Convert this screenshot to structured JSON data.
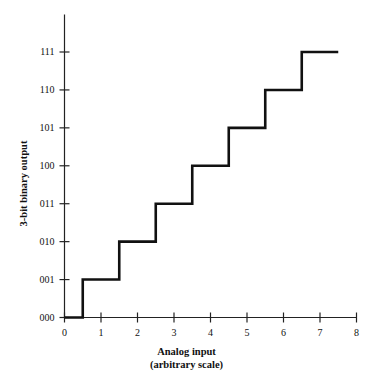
{
  "chart_data": {
    "type": "line",
    "title": "",
    "subtitle": "",
    "xlabel": "Analog input",
    "xlabel_line2": "(arbitrary scale)",
    "ylabel": "3-bit binary output",
    "xlim": [
      0,
      8
    ],
    "ylim": [
      0,
      7
    ],
    "grid": false,
    "legend": null,
    "x_ticks": [
      0,
      1,
      2,
      3,
      4,
      5,
      6,
      7,
      8
    ],
    "x_tick_labels": [
      "0",
      "1",
      "2",
      "3",
      "4",
      "5",
      "6",
      "7",
      "8"
    ],
    "y_ticks": [
      0,
      1,
      2,
      3,
      4,
      5,
      6,
      7
    ],
    "y_tick_labels": [
      "000",
      "001",
      "010",
      "011",
      "100",
      "101",
      "110",
      "111"
    ],
    "series": [
      {
        "name": "quantizer staircase",
        "style": "step-post",
        "color": "#111111",
        "line_width": 2.6,
        "x": [
          0,
          0.5,
          0.5,
          1.5,
          1.5,
          2.5,
          2.5,
          3.5,
          3.5,
          4.5,
          4.5,
          5.5,
          5.5,
          6.5,
          6.5,
          7.5
        ],
        "y": [
          0,
          0,
          1,
          1,
          2,
          2,
          3,
          3,
          4,
          4,
          5,
          5,
          6,
          6,
          7,
          7
        ],
        "steps": [
          {
            "code": "000",
            "level": 0,
            "x_start": 0.0,
            "x_end": 0.5
          },
          {
            "code": "001",
            "level": 1,
            "x_start": 0.5,
            "x_end": 1.5
          },
          {
            "code": "010",
            "level": 2,
            "x_start": 1.5,
            "x_end": 2.5
          },
          {
            "code": "011",
            "level": 3,
            "x_start": 2.5,
            "x_end": 3.5
          },
          {
            "code": "100",
            "level": 4,
            "x_start": 3.5,
            "x_end": 4.5
          },
          {
            "code": "101",
            "level": 5,
            "x_start": 4.5,
            "x_end": 5.5
          },
          {
            "code": "110",
            "level": 6,
            "x_start": 5.5,
            "x_end": 6.5
          },
          {
            "code": "111",
            "level": 7,
            "x_start": 6.5,
            "x_end": 7.5
          }
        ]
      }
    ],
    "axis_color": "#222222",
    "background": "#ffffff"
  }
}
